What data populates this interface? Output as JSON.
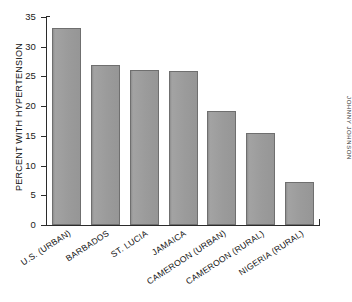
{
  "chart_data": {
    "type": "bar",
    "title": "",
    "subtitle": "",
    "xlabel": "",
    "ylabel": "PERCENT WITH HYPERTENSION",
    "ylim": [
      0,
      35
    ],
    "yticks": [
      0,
      5,
      10,
      15,
      20,
      25,
      30,
      35
    ],
    "ytick_labels": [
      "0",
      "5",
      "10",
      "15",
      "20",
      "25",
      "30",
      "35"
    ],
    "grid": false,
    "legend": false,
    "legend_position": "none",
    "orientation": "vertical",
    "bar_color": "#9a9a9a",
    "bar_edge_color": "#6f6f6f",
    "axis_color": "#2b2b2b",
    "background_color": "#ffffff",
    "categories": [
      "U.S. (URBAN)",
      "BARBADOS",
      "ST. LUCIA",
      "JAMAICA",
      "CAMEROON (URBAN)",
      "CAMEROON (RURAL)",
      "NIGERIA (RURAL)"
    ],
    "values": [
      33.1,
      26.9,
      26.1,
      26.0,
      19.2,
      15.5,
      7.2
    ]
  },
  "credit": {
    "text": "JOHNNY JOHNSON"
  }
}
